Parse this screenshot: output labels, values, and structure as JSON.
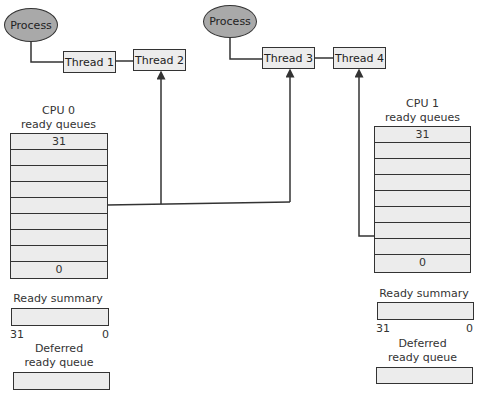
{
  "processes": [
    {
      "label": "Process"
    },
    {
      "label": "Process"
    }
  ],
  "threads": [
    {
      "label": "Thread 1"
    },
    {
      "label": "Thread 2"
    },
    {
      "label": "Thread 3"
    },
    {
      "label": "Thread 4"
    }
  ],
  "cpu0": {
    "title_line1": "CPU 0",
    "title_line2": "ready queues",
    "rows": [
      "31",
      "",
      "",
      "",
      "",
      "",
      "",
      "",
      "0"
    ],
    "ready_summary_label": "Ready summary",
    "summary_left": "31",
    "summary_right": "0",
    "deferred_line1": "Deferred",
    "deferred_line2": "ready queue"
  },
  "cpu1": {
    "title_line1": "CPU 1",
    "title_line2": "ready queues",
    "rows": [
      "31",
      "",
      "",
      "",
      "",
      "",
      "",
      "",
      "0"
    ],
    "ready_summary_label": "Ready summary",
    "summary_left": "31",
    "summary_right": "0",
    "deferred_line1": "Deferred",
    "deferred_line2": "ready queue"
  },
  "colors": {
    "process_fill": "#a9a9a9",
    "box_fill": "#ececec",
    "line": "#333333"
  }
}
